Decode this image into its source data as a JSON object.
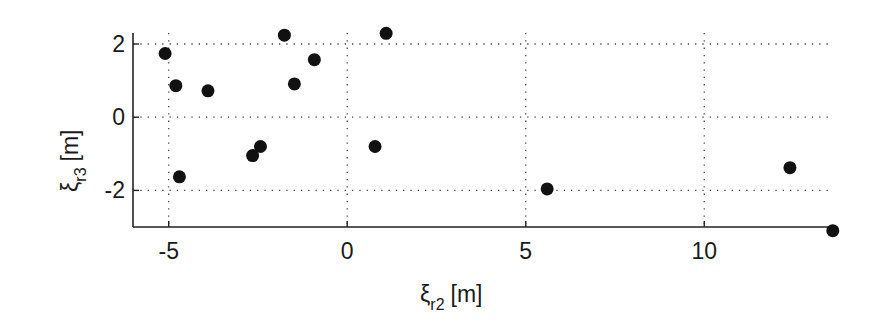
{
  "chart_data": {
    "type": "scatter",
    "title": "",
    "xlabel": "ξ_r2 [m]",
    "ylabel": "ξ_r3 [m]",
    "xlabel_parts": {
      "symbol": "ξ",
      "sub": "r2",
      "unit": "[m]"
    },
    "ylabel_parts": {
      "symbol": "ξ",
      "sub": "r3",
      "unit": "[m]"
    },
    "xlim": [
      -6,
      13.55
    ],
    "ylim": [
      -3,
      2.3
    ],
    "xticks": [
      -5,
      0,
      5,
      10
    ],
    "yticks": [
      -2,
      0,
      2
    ],
    "xtick_labels": [
      "-5",
      "0",
      "5",
      "10"
    ],
    "ytick_labels": [
      "-2",
      "0",
      "2"
    ],
    "grid": true,
    "grid_style": "dotted",
    "legend": null,
    "marker": "filled-circle",
    "marker_color": "#111111",
    "points": [
      {
        "x": -5.1,
        "y": 1.74
      },
      {
        "x": -4.8,
        "y": 0.86
      },
      {
        "x": -3.9,
        "y": 0.72
      },
      {
        "x": -4.7,
        "y": -1.63
      },
      {
        "x": -1.76,
        "y": 2.24
      },
      {
        "x": -1.48,
        "y": 0.91
      },
      {
        "x": -0.92,
        "y": 1.57
      },
      {
        "x": -2.65,
        "y": -1.05
      },
      {
        "x": -2.43,
        "y": -0.8
      },
      {
        "x": 1.09,
        "y": 2.29
      },
      {
        "x": 0.78,
        "y": -0.8
      },
      {
        "x": 5.6,
        "y": -1.96
      },
      {
        "x": 12.4,
        "y": -1.38
      },
      {
        "x": 13.6,
        "y": -3.1
      }
    ]
  }
}
